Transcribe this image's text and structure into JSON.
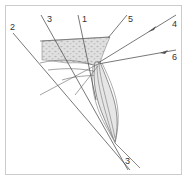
{
  "diagram": {
    "type": "dental radiographic projection diagram",
    "colors": {
      "line": "#555555",
      "frame": "#cccccc",
      "bone_fill": "#d9d9d9",
      "stipple": "#b5b5b5",
      "tooth_fill": "#e6e6e6"
    },
    "labels": {
      "l1": "1",
      "l2": "2",
      "l3_top": "3",
      "l3_bottom": "3",
      "l4": "4",
      "l5": "5",
      "l6": "6"
    }
  }
}
